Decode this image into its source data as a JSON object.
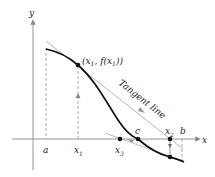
{
  "diagram": {
    "axes": {
      "x_label": "x",
      "y_label": "y"
    },
    "x_ticks": [
      {
        "name": "a",
        "label": "a"
      },
      {
        "name": "x1",
        "label": "x",
        "sub": "1"
      },
      {
        "name": "x3",
        "label": "x",
        "sub": "3"
      },
      {
        "name": "c",
        "label": "c"
      },
      {
        "name": "x2",
        "label": "x",
        "sub": "2"
      },
      {
        "name": "b",
        "label": "b"
      }
    ],
    "point_label": {
      "text": "(x",
      "sub1": "1",
      "mid": ", f(x",
      "sub2": "1",
      "end": "))"
    },
    "tangent_label": "Tangent line",
    "colors": {
      "curve": "#111111",
      "tangent": "#aaaaaa",
      "axis": "#888888",
      "dashed": "#888888",
      "point": "#111111"
    }
  }
}
